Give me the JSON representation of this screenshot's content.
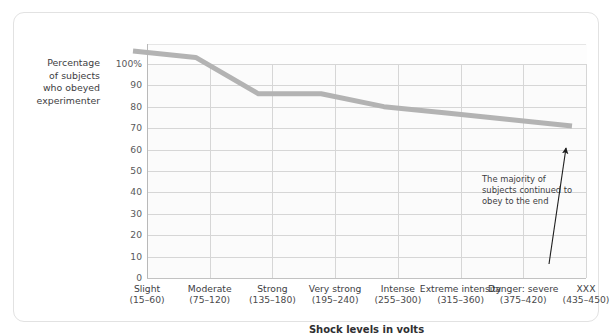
{
  "figure": {
    "clipped_header": "",
    "background": "#ffffff",
    "card_border_color": "#e2e2e2"
  },
  "chart_data": {
    "type": "line",
    "title": "",
    "xlabel": "Shock levels in volts",
    "ylabel": "Percentage of subjects who obeyed experimenter",
    "ylim": [
      0,
      100
    ],
    "ytick_labels": [
      "100%",
      "90",
      "80",
      "70",
      "60",
      "50",
      "40",
      "30",
      "20",
      "10",
      "0"
    ],
    "ytick_values": [
      100,
      90,
      80,
      70,
      60,
      50,
      40,
      30,
      20,
      10,
      0
    ],
    "grid": true,
    "legend": "none",
    "line_color": "#b3b3b3",
    "categories": [
      "Slight",
      "Moderate",
      "Strong",
      "Very strong",
      "Intense",
      "Extreme intensity",
      "Danger: severe",
      "XXX"
    ],
    "category_ranges": [
      "(15–60)",
      "(75–120)",
      "(135–180)",
      "(195–240)",
      "(255–300)",
      "(315–360)",
      "(375–420)",
      "(435–450)"
    ],
    "values": [
      100,
      97,
      80,
      80,
      74,
      71,
      68,
      65
    ],
    "annotations": [
      {
        "text": "The majority of subjects continued to obey to the end",
        "arrow": "upward-pointing"
      }
    ]
  },
  "axis": {
    "y_title_lines": [
      "Percentage",
      "of subjects",
      "who obeyed",
      "experimenter"
    ],
    "x_title": "Shock levels in volts"
  },
  "xticks": [
    {
      "name": "Slight",
      "range": "(15–60)"
    },
    {
      "name": "Moderate",
      "range": "(75–120)"
    },
    {
      "name": "Strong",
      "range": "(135–180)"
    },
    {
      "name": "Very strong",
      "range": "(195–240)"
    },
    {
      "name": "Intense",
      "range": "(255–300)"
    },
    {
      "name": "Extreme intensity",
      "range": "(315–360)"
    },
    {
      "name": "Danger: severe",
      "range": "(375–420)"
    },
    {
      "name": "XXX",
      "range": "(435–450)"
    }
  ],
  "annotation": {
    "text": "The majority of subjects continued to obey to the end"
  }
}
